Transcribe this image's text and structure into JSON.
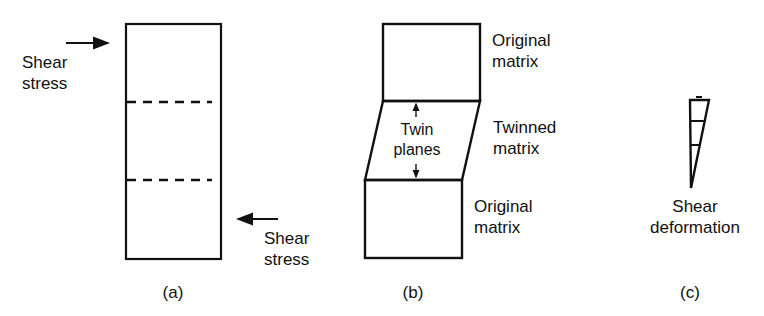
{
  "panels": {
    "a": {
      "caption": "(a)",
      "top_label_line1": "Shear",
      "top_label_line2": "stress",
      "bottom_label_line1": "Shear",
      "bottom_label_line2": "stress"
    },
    "b": {
      "caption": "(b)",
      "top_label_line1": "Original",
      "top_label_line2": "matrix",
      "middle_label_line1": "Twinned",
      "middle_label_line2": "matrix",
      "bottom_label_line1": "Original",
      "bottom_label_line2": "matrix",
      "inner_label_line1": "Twin",
      "inner_label_line2": "planes"
    },
    "c": {
      "caption": "(c)",
      "label_line1": "Shear",
      "label_line2": "deformation"
    }
  },
  "colors": {
    "stroke": "#111111",
    "background": "#ffffff"
  }
}
